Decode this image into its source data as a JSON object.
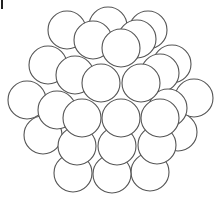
{
  "diagram": {
    "type": "sphere-packing-cluster",
    "background": "#ffffff",
    "stroke_color": "#555555",
    "fill_color": "#ffffff",
    "stroke_width": 1.1,
    "radius": 19,
    "circles": [
      {
        "x": 108,
        "y": 26,
        "layer": 0
      },
      {
        "x": 67,
        "y": 30,
        "layer": 0
      },
      {
        "x": 148,
        "y": 30,
        "layer": 0
      },
      {
        "x": 48,
        "y": 65,
        "layer": 0
      },
      {
        "x": 172,
        "y": 64,
        "layer": 0
      },
      {
        "x": 27,
        "y": 100,
        "layer": 0
      },
      {
        "x": 194,
        "y": 98,
        "layer": 0
      },
      {
        "x": 43,
        "y": 135,
        "layer": 0
      },
      {
        "x": 178,
        "y": 132,
        "layer": 0
      },
      {
        "x": 73,
        "y": 173,
        "layer": 0
      },
      {
        "x": 112,
        "y": 174,
        "layer": 0
      },
      {
        "x": 150,
        "y": 172,
        "layer": 0
      },
      {
        "x": 93,
        "y": 40,
        "layer": 1
      },
      {
        "x": 137,
        "y": 39,
        "layer": 1
      },
      {
        "x": 75,
        "y": 75,
        "layer": 1
      },
      {
        "x": 160,
        "y": 73,
        "layer": 1
      },
      {
        "x": 57,
        "y": 110,
        "layer": 1
      },
      {
        "x": 168,
        "y": 108,
        "layer": 1
      },
      {
        "x": 77,
        "y": 146,
        "layer": 1
      },
      {
        "x": 117,
        "y": 146,
        "layer": 1
      },
      {
        "x": 157,
        "y": 145,
        "layer": 1
      },
      {
        "x": 121,
        "y": 48,
        "layer": 2
      },
      {
        "x": 101,
        "y": 83,
        "layer": 2
      },
      {
        "x": 141,
        "y": 83,
        "layer": 2
      },
      {
        "x": 82,
        "y": 118,
        "layer": 2
      },
      {
        "x": 121,
        "y": 118,
        "layer": 2
      },
      {
        "x": 160,
        "y": 118,
        "layer": 2
      }
    ]
  }
}
